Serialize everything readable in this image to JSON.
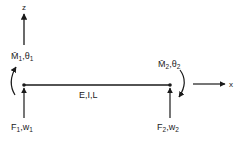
{
  "diagram": {
    "type": "beam-element",
    "colors": {
      "stroke": "#1a1a1a",
      "background": "#ffffff",
      "text": "#222222"
    },
    "axes": {
      "z": {
        "label": "z"
      },
      "x": {
        "label": "x"
      }
    },
    "beam": {
      "label": "E,I,L"
    },
    "node1": {
      "moment_label": "M̄",
      "moment_sub": "1",
      "rotation_label": "θ",
      "rotation_sub": "1",
      "force_label": "F",
      "force_sub": "1",
      "disp_label": "w",
      "disp_sub": "1"
    },
    "node2": {
      "moment_label": "M̄",
      "moment_sub": "2",
      "rotation_label": "θ",
      "rotation_sub": "2",
      "force_label": "F",
      "force_sub": "2",
      "disp_label": "w",
      "disp_sub": "2"
    },
    "separator": ","
  }
}
